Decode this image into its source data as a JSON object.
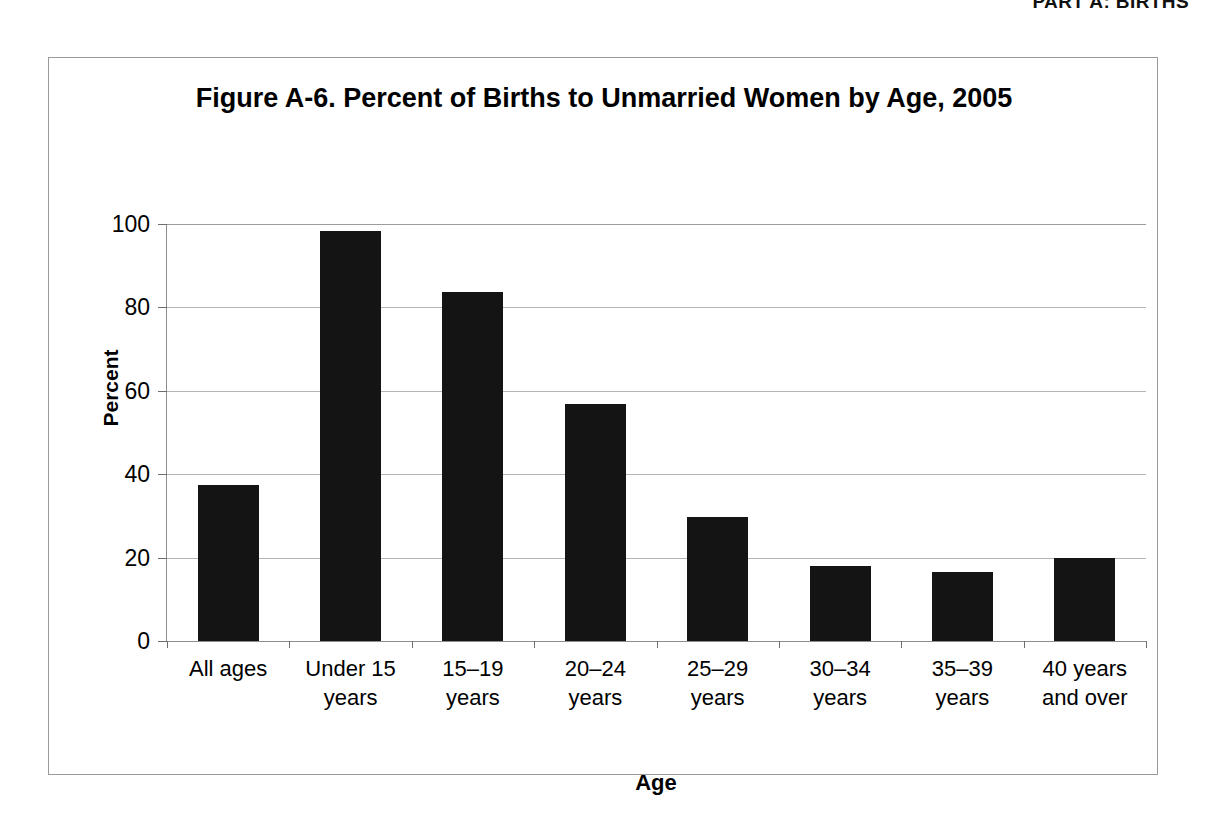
{
  "page": {
    "running_header": "PART A: BIRTHS"
  },
  "figure": {
    "title": "Figure A-6. Percent of Births to Unmarried Women by Age, 2005"
  },
  "chart_data": {
    "type": "bar",
    "title": "Figure A-6. Percent of Births to Unmarried Women by Age, 2005",
    "subtitle": "",
    "xlabel": "Age",
    "ylabel": "Percent",
    "categories": [
      "All ages",
      "Under 15\nyears",
      "15–19\nyears",
      "20–24\nyears",
      "25–29\nyears",
      "30–34\nyears",
      "35–39\nyears",
      "40 years\nand over"
    ],
    "values": [
      37.4,
      98.4,
      83.7,
      56.8,
      29.7,
      18.0,
      16.5,
      19.9
    ],
    "ylim": [
      0,
      100
    ],
    "ytick_labels": [
      "100",
      "80",
      "60",
      "40",
      "20",
      "0"
    ],
    "ytick_values": [
      100,
      80,
      60,
      40,
      20,
      0
    ],
    "grid": true,
    "legend": false,
    "bar_color": "#141414",
    "grid_color": "#b4b4b4",
    "axis_color": "#8e8e8e"
  }
}
